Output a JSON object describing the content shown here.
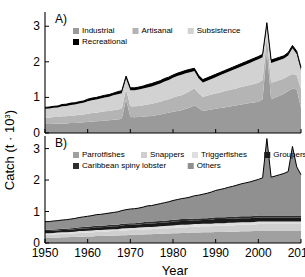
{
  "figure": {
    "ylabel": "Catch (t · 10",
    "ylabel_exp": "3",
    "ylabel_close": ")",
    "xlabel": "Year",
    "panel_a_tag": "A)",
    "panel_b_tag": "B)"
  },
  "chart_data": [
    {
      "type": "area",
      "panel": "A)",
      "title": "",
      "xlabel": "",
      "ylabel": "Catch (t · 10³)",
      "xlim": [
        1950,
        2010
      ],
      "ylim": [
        0,
        3.4
      ],
      "xticks": [
        1950,
        1960,
        1970,
        1980,
        1990,
        2000,
        2010
      ],
      "yticks": [
        0,
        1,
        2,
        3
      ],
      "grid": false,
      "stacked": true,
      "legend_position": "top-left",
      "legend": [
        "Industrial",
        "Artisanal",
        "Subsistence",
        "Recreational"
      ],
      "colors": {
        "Industrial": "#9a9a9a",
        "Artisanal": "#b4b4b4",
        "Subsistence": "#d2d2d2",
        "Recreational": "#000000"
      },
      "x": [
        1950,
        1951,
        1952,
        1953,
        1954,
        1955,
        1956,
        1957,
        1958,
        1959,
        1960,
        1961,
        1962,
        1963,
        1964,
        1965,
        1966,
        1967,
        1968,
        1969,
        1970,
        1971,
        1972,
        1973,
        1974,
        1975,
        1976,
        1977,
        1978,
        1979,
        1980,
        1981,
        1982,
        1983,
        1984,
        1985,
        1986,
        1987,
        1988,
        1989,
        1990,
        1991,
        1992,
        1993,
        1994,
        1995,
        1996,
        1997,
        1998,
        1999,
        2000,
        2001,
        2002,
        2003,
        2004,
        2005,
        2006,
        2007,
        2008,
        2009,
        2010
      ],
      "series": [
        {
          "name": "Industrial",
          "values": [
            0.25,
            0.25,
            0.26,
            0.26,
            0.27,
            0.27,
            0.28,
            0.28,
            0.29,
            0.3,
            0.31,
            0.32,
            0.33,
            0.34,
            0.35,
            0.36,
            0.37,
            0.38,
            0.4,
            0.95,
            0.45,
            0.44,
            0.45,
            0.46,
            0.47,
            0.48,
            0.5,
            0.52,
            0.55,
            0.57,
            0.6,
            0.62,
            0.64,
            0.68,
            0.72,
            0.78,
            0.7,
            0.62,
            0.64,
            0.66,
            0.68,
            0.7,
            0.72,
            0.74,
            0.76,
            0.78,
            0.8,
            0.82,
            0.84,
            0.86,
            0.88,
            0.95,
            2.3,
            0.95,
            1.0,
            1.05,
            1.1,
            1.18,
            1.25,
            1.22,
            0.7
          ]
        },
        {
          "name": "Artisanal",
          "values": [
            0.18,
            0.18,
            0.19,
            0.19,
            0.2,
            0.2,
            0.21,
            0.21,
            0.22,
            0.22,
            0.23,
            0.24,
            0.24,
            0.25,
            0.26,
            0.26,
            0.27,
            0.28,
            0.28,
            0.28,
            0.3,
            0.31,
            0.31,
            0.32,
            0.33,
            0.34,
            0.35,
            0.36,
            0.37,
            0.38,
            0.4,
            0.41,
            0.42,
            0.44,
            0.46,
            0.48,
            0.42,
            0.4,
            0.41,
            0.42,
            0.43,
            0.44,
            0.45,
            0.46,
            0.47,
            0.48,
            0.49,
            0.5,
            0.51,
            0.52,
            0.53,
            0.54,
            0.4,
            0.46,
            0.45,
            0.44,
            0.43,
            0.42,
            0.41,
            0.4,
            0.52
          ]
        },
        {
          "name": "Subsistence",
          "values": [
            0.25,
            0.26,
            0.26,
            0.27,
            0.28,
            0.29,
            0.3,
            0.31,
            0.32,
            0.33,
            0.35,
            0.36,
            0.37,
            0.38,
            0.39,
            0.4,
            0.42,
            0.43,
            0.44,
            0.3,
            0.45,
            0.45,
            0.46,
            0.47,
            0.48,
            0.49,
            0.5,
            0.51,
            0.53,
            0.54,
            0.55,
            0.57,
            0.58,
            0.56,
            0.53,
            0.48,
            0.42,
            0.4,
            0.42,
            0.44,
            0.46,
            0.48,
            0.5,
            0.52,
            0.54,
            0.56,
            0.58,
            0.6,
            0.62,
            0.64,
            0.66,
            0.64,
            0.32,
            0.56,
            0.56,
            0.56,
            0.56,
            0.58,
            0.72,
            0.6,
            0.54
          ]
        },
        {
          "name": "Recreational",
          "values": [
            0.04,
            0.04,
            0.04,
            0.04,
            0.05,
            0.05,
            0.05,
            0.05,
            0.05,
            0.05,
            0.06,
            0.06,
            0.06,
            0.06,
            0.06,
            0.06,
            0.06,
            0.07,
            0.07,
            0.07,
            0.07,
            0.07,
            0.07,
            0.07,
            0.08,
            0.08,
            0.08,
            0.08,
            0.08,
            0.08,
            0.08,
            0.08,
            0.08,
            0.08,
            0.08,
            0.08,
            0.08,
            0.08,
            0.08,
            0.08,
            0.08,
            0.08,
            0.08,
            0.08,
            0.08,
            0.08,
            0.08,
            0.08,
            0.08,
            0.08,
            0.08,
            0.08,
            0.08,
            0.08,
            0.08,
            0.08,
            0.08,
            0.08,
            0.08,
            0.08,
            0.08
          ]
        }
      ]
    },
    {
      "type": "area",
      "panel": "B)",
      "title": "",
      "xlabel": "Year",
      "ylabel": "Catch (t · 10³)",
      "xlim": [
        1950,
        2010
      ],
      "ylim": [
        0,
        3.4
      ],
      "xticks": [
        1950,
        1960,
        1970,
        1980,
        1990,
        2000,
        2010
      ],
      "yticks": [
        0,
        1,
        2,
        3
      ],
      "grid": false,
      "stacked": true,
      "legend_position": "top-left",
      "legend": [
        "Parrotfishes",
        "Snappers",
        "Triggerfishes",
        "Groupers",
        "Caribbean spiny lobster",
        "Others"
      ],
      "colors": {
        "Parrotfishes": "#a0a0a0",
        "Snappers": "#cfcfcf",
        "Triggerfishes": "#dedede",
        "Groupers": "#1a1a1a",
        "Caribbean spiny lobster": "#2e2e2e",
        "Others": "#909090"
      },
      "x": [
        1950,
        1951,
        1952,
        1953,
        1954,
        1955,
        1956,
        1957,
        1958,
        1959,
        1960,
        1961,
        1962,
        1963,
        1964,
        1965,
        1966,
        1967,
        1968,
        1969,
        1970,
        1971,
        1972,
        1973,
        1974,
        1975,
        1976,
        1977,
        1978,
        1979,
        1980,
        1981,
        1982,
        1983,
        1984,
        1985,
        1986,
        1987,
        1988,
        1989,
        1990,
        1991,
        1992,
        1993,
        1994,
        1995,
        1996,
        1997,
        1998,
        1999,
        2000,
        2001,
        2002,
        2003,
        2004,
        2005,
        2006,
        2007,
        2008,
        2009,
        2010
      ],
      "series": [
        {
          "name": "Parrotfishes",
          "values": [
            0.16,
            0.16,
            0.17,
            0.17,
            0.18,
            0.18,
            0.19,
            0.19,
            0.2,
            0.2,
            0.21,
            0.21,
            0.22,
            0.22,
            0.23,
            0.23,
            0.24,
            0.24,
            0.25,
            0.25,
            0.26,
            0.26,
            0.27,
            0.27,
            0.28,
            0.28,
            0.29,
            0.29,
            0.3,
            0.3,
            0.31,
            0.31,
            0.32,
            0.32,
            0.33,
            0.33,
            0.33,
            0.34,
            0.34,
            0.34,
            0.35,
            0.35,
            0.35,
            0.36,
            0.36,
            0.36,
            0.37,
            0.37,
            0.37,
            0.38,
            0.38,
            0.38,
            0.38,
            0.38,
            0.38,
            0.38,
            0.38,
            0.38,
            0.38,
            0.38,
            0.38
          ]
        },
        {
          "name": "Snappers",
          "values": [
            0.1,
            0.1,
            0.1,
            0.11,
            0.11,
            0.11,
            0.11,
            0.12,
            0.12,
            0.12,
            0.12,
            0.13,
            0.13,
            0.13,
            0.13,
            0.14,
            0.14,
            0.14,
            0.14,
            0.15,
            0.15,
            0.15,
            0.15,
            0.16,
            0.16,
            0.16,
            0.16,
            0.17,
            0.17,
            0.17,
            0.17,
            0.18,
            0.18,
            0.18,
            0.18,
            0.19,
            0.19,
            0.19,
            0.19,
            0.19,
            0.2,
            0.2,
            0.2,
            0.2,
            0.2,
            0.21,
            0.21,
            0.21,
            0.21,
            0.21,
            0.22,
            0.22,
            0.22,
            0.22,
            0.22,
            0.22,
            0.22,
            0.22,
            0.22,
            0.22,
            0.22
          ]
        },
        {
          "name": "Triggerfishes",
          "values": [
            0.05,
            0.05,
            0.05,
            0.05,
            0.05,
            0.05,
            0.05,
            0.05,
            0.06,
            0.06,
            0.06,
            0.06,
            0.06,
            0.06,
            0.06,
            0.06,
            0.06,
            0.06,
            0.07,
            0.07,
            0.07,
            0.07,
            0.07,
            0.07,
            0.07,
            0.07,
            0.07,
            0.07,
            0.07,
            0.08,
            0.08,
            0.08,
            0.08,
            0.08,
            0.08,
            0.08,
            0.08,
            0.08,
            0.08,
            0.08,
            0.08,
            0.08,
            0.08,
            0.08,
            0.08,
            0.08,
            0.08,
            0.08,
            0.08,
            0.08,
            0.08,
            0.08,
            0.08,
            0.08,
            0.08,
            0.08,
            0.08,
            0.08,
            0.08,
            0.08,
            0.08
          ]
        },
        {
          "name": "Groupers",
          "values": [
            0.07,
            0.07,
            0.07,
            0.07,
            0.07,
            0.07,
            0.08,
            0.08,
            0.08,
            0.08,
            0.08,
            0.08,
            0.09,
            0.09,
            0.09,
            0.09,
            0.09,
            0.09,
            0.1,
            0.1,
            0.1,
            0.1,
            0.1,
            0.1,
            0.11,
            0.11,
            0.11,
            0.11,
            0.11,
            0.11,
            0.12,
            0.12,
            0.12,
            0.12,
            0.12,
            0.12,
            0.12,
            0.12,
            0.12,
            0.13,
            0.13,
            0.13,
            0.13,
            0.13,
            0.13,
            0.13,
            0.13,
            0.13,
            0.13,
            0.13,
            0.13,
            0.13,
            0.13,
            0.13,
            0.13,
            0.13,
            0.13,
            0.13,
            0.13,
            0.13,
            0.13
          ]
        },
        {
          "name": "Caribbean spiny lobster",
          "values": [
            0.04,
            0.04,
            0.04,
            0.04,
            0.04,
            0.04,
            0.04,
            0.04,
            0.04,
            0.05,
            0.05,
            0.05,
            0.05,
            0.05,
            0.05,
            0.05,
            0.05,
            0.05,
            0.05,
            0.05,
            0.05,
            0.05,
            0.05,
            0.06,
            0.06,
            0.06,
            0.06,
            0.06,
            0.06,
            0.06,
            0.06,
            0.06,
            0.06,
            0.06,
            0.06,
            0.06,
            0.06,
            0.06,
            0.06,
            0.06,
            0.06,
            0.06,
            0.06,
            0.06,
            0.06,
            0.06,
            0.06,
            0.06,
            0.06,
            0.06,
            0.06,
            0.06,
            0.06,
            0.06,
            0.06,
            0.06,
            0.06,
            0.06,
            0.06,
            0.06,
            0.06
          ]
        },
        {
          "name": "Others",
          "values": [
            0.26,
            0.26,
            0.27,
            0.27,
            0.28,
            0.29,
            0.29,
            0.3,
            0.31,
            0.32,
            0.33,
            0.34,
            0.35,
            0.36,
            0.37,
            0.38,
            0.39,
            0.41,
            0.42,
            0.44,
            0.45,
            0.46,
            0.47,
            0.48,
            0.5,
            0.51,
            0.53,
            0.55,
            0.57,
            0.59,
            0.61,
            0.63,
            0.65,
            0.67,
            0.69,
            0.72,
            0.74,
            0.76,
            0.79,
            0.82,
            0.85,
            0.88,
            0.91,
            0.94,
            0.97,
            1.0,
            1.03,
            1.06,
            1.09,
            1.12,
            1.15,
            1.2,
            2.45,
            1.22,
            1.26,
            1.3,
            1.34,
            1.4,
            2.2,
            1.55,
            1.3
          ]
        }
      ]
    }
  ],
  "panel_a": {
    "tag": "A)",
    "legend": [
      {
        "label": "Industrial",
        "color": "#9a9a9a"
      },
      {
        "label": "Artisanal",
        "color": "#b4b4b4"
      },
      {
        "label": "Subsistence",
        "color": "#d2d2d2"
      },
      {
        "label": "Recreational",
        "color": "#000000"
      }
    ],
    "yticks": [
      "0",
      "1",
      "2",
      "3"
    ]
  },
  "panel_b": {
    "tag": "B)",
    "legend": [
      {
        "label": "Parrotfishes",
        "color": "#a0a0a0"
      },
      {
        "label": "Snappers",
        "color": "#cfcfcf"
      },
      {
        "label": "Triggerfishes",
        "color": "#dedede"
      },
      {
        "label": "Groupers",
        "color": "#1a1a1a"
      },
      {
        "label": "Caribbean spiny lobster",
        "color": "#2e2e2e"
      },
      {
        "label": "Others",
        "color": "#909090"
      }
    ],
    "yticks": [
      "0",
      "1",
      "2",
      "3"
    ],
    "xticks": [
      "1950",
      "1960",
      "1970",
      "1980",
      "1990",
      "2000",
      "2010"
    ]
  }
}
